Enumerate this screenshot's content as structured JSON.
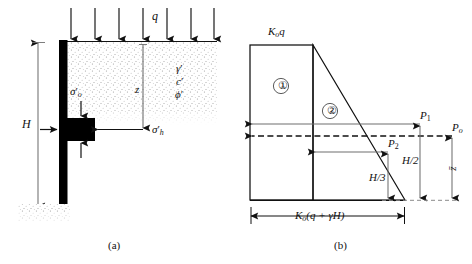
{
  "figure": {
    "panels": [
      {
        "id": "a",
        "caption": "(a)",
        "description": "Retaining wall with soil element at depth z under surcharge q"
      },
      {
        "id": "b",
        "caption": "(b)",
        "description": "At-rest lateral earth pressure distribution diagram"
      }
    ]
  },
  "panel_a": {
    "caption": "(a)",
    "surcharge_label": "q",
    "depth_label": "z",
    "wall_height_label": "H",
    "vertical_stress_label": "σ",
    "vertical_stress_prime": "′",
    "vertical_stress_sub": "o",
    "horizontal_stress_label": "σ",
    "horizontal_stress_prime": "′",
    "horizontal_stress_sub": "h",
    "soil_params": [
      {
        "symbol": "γ",
        "prime": "′"
      },
      {
        "symbol": "c",
        "prime": "′"
      },
      {
        "symbol": "ϕ",
        "prime": "′"
      }
    ],
    "surcharge_arrow_count": 7
  },
  "panel_b": {
    "caption": "(b)",
    "top_pressure_label_k": "K",
    "top_pressure_label_sub": "o",
    "top_pressure_label_q": "q",
    "bottom_pressure_label": "K",
    "bottom_pressure_sub": "o",
    "bottom_pressure_expr": "(q + γH)",
    "region_one": "①",
    "region_two": "②",
    "force_p1": "P",
    "force_p1_sub": "1",
    "force_p2": "P",
    "force_p2_sub": "2",
    "force_po": "P",
    "force_po_sub": "o",
    "dim_h_over_2": "H/2",
    "dim_h_over_3": "H/3",
    "dim_zbar": "z̄"
  },
  "colors": {
    "line": "#111111",
    "wall_fill": "#000000",
    "soil_stipple": "#9a9a9a",
    "background": "#ffffff",
    "dashed": "#111111"
  }
}
